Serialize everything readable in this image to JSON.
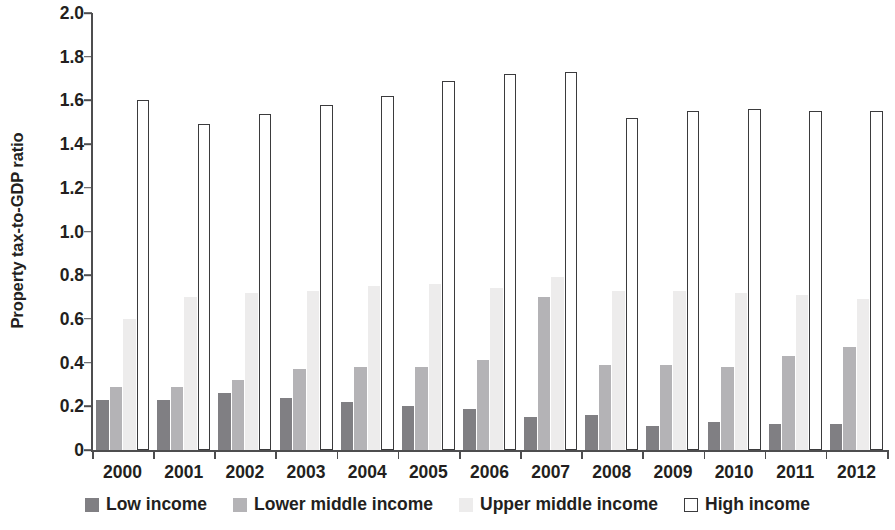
{
  "chart_data": {
    "type": "bar",
    "title": "",
    "subtitle": "",
    "xlabel": "",
    "ylabel": "Property tax-to-GDP ratio",
    "categories": [
      "2000",
      "2001",
      "2002",
      "2003",
      "2004",
      "2005",
      "2006",
      "2007",
      "2008",
      "2009",
      "2010",
      "2011",
      "2012"
    ],
    "ylim": [
      0,
      2.0
    ],
    "y_ticks": [
      "0",
      "0.2",
      "0.4",
      "0.6",
      "0.8",
      "1.0",
      "1.2",
      "1.4",
      "1.6",
      "1.8",
      "2.0"
    ],
    "y_tick_values": [
      0,
      0.2,
      0.4,
      0.6,
      0.8,
      1.0,
      1.2,
      1.4,
      1.6,
      1.8,
      2.0
    ],
    "grid": false,
    "legend_position": "bottom",
    "series": [
      {
        "name": "Low income",
        "color": "#807f83",
        "values": [
          0.23,
          0.23,
          0.26,
          0.24,
          0.22,
          0.2,
          0.19,
          0.15,
          0.16,
          0.11,
          0.13,
          0.12,
          0.12
        ]
      },
      {
        "name": "Lower middle income",
        "color": "#b4b3b6",
        "values": [
          0.29,
          0.29,
          0.32,
          0.37,
          0.38,
          0.38,
          0.41,
          0.7,
          0.39,
          0.39,
          0.38,
          0.43,
          0.47
        ]
      },
      {
        "name": "Upper middle income",
        "color": "#edecec",
        "values": [
          0.6,
          0.7,
          0.72,
          0.73,
          0.75,
          0.76,
          0.74,
          0.79,
          0.73,
          0.73,
          0.72,
          0.71,
          0.69
        ]
      },
      {
        "name": "High income",
        "color": "#ffffff",
        "border_color": "#3b3b3d",
        "values": [
          1.6,
          1.49,
          1.54,
          1.58,
          1.62,
          1.69,
          1.72,
          1.73,
          1.52,
          1.55,
          1.56,
          1.55,
          1.55
        ]
      }
    ]
  },
  "legend": {
    "items": [
      {
        "label": "Low income",
        "key": "low"
      },
      {
        "label": "Lower middle income",
        "key": "lowermid"
      },
      {
        "label": "Upper middle income",
        "key": "uppermid"
      },
      {
        "label": "High income",
        "key": "high"
      }
    ]
  }
}
